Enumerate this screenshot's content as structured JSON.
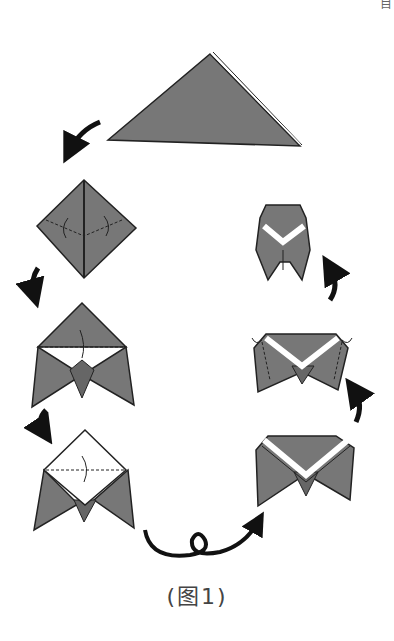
{
  "figure": {
    "caption": "(图1)",
    "corner_text": "目",
    "paper_color": "#777777",
    "outline_color": "#222222",
    "arrow_color": "#111111"
  },
  "steps": [
    {
      "id": 1,
      "shape": "triangle"
    },
    {
      "id": 2,
      "shape": "diamond-with-fold-lines"
    },
    {
      "id": 3,
      "shape": "folded-wings"
    },
    {
      "id": 4,
      "shape": "white-flap-fold-down"
    },
    {
      "id": 5,
      "shape": "turn-over-v-band"
    },
    {
      "id": 6,
      "shape": "side-folds-back"
    },
    {
      "id": 7,
      "shape": "finished-cicada"
    }
  ]
}
